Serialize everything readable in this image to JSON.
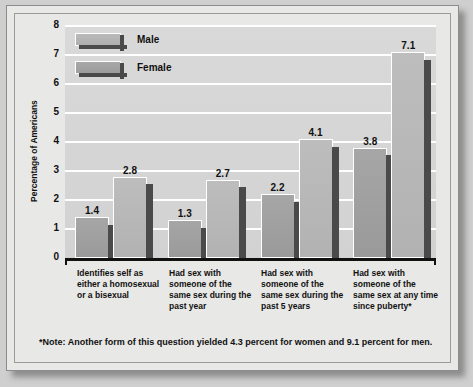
{
  "chart_data": {
    "type": "bar",
    "title": "",
    "xlabel": "",
    "ylabel": "Percentage of Americans",
    "ylim": [
      0,
      8
    ],
    "yticks": [
      "8",
      "7",
      "6",
      "5",
      "4",
      "3",
      "2",
      "1",
      "0"
    ],
    "grid": true,
    "legend_position": "top-left",
    "categories": [
      "Identifies self as either a homosexual or a bisexual",
      "Had sex with someone of the same sex during the past year",
      "Had sex with someone of the same sex during the past 5 years",
      "Had sex with someone of the same sex at any time since puberty*"
    ],
    "series": [
      {
        "name": "Male",
        "values": [
          1.4,
          1.3,
          2.2,
          3.8
        ]
      },
      {
        "name": "Female",
        "values": [
          2.8,
          2.7,
          4.1,
          7.1
        ]
      }
    ],
    "value_labels": [
      "1.4",
      "2.8",
      "1.3",
      "2.7",
      "2.2",
      "4.1",
      "3.8",
      "7.1"
    ],
    "note": "*Note: Another form of this question yielded 4.3 percent for women and 9.1 percent for men."
  },
  "legend": {
    "items": [
      {
        "label": "Male",
        "color": "#aeaeae"
      },
      {
        "label": "Female",
        "color": "#9d9d9d"
      }
    ]
  },
  "colors": {
    "male_bar": "#9a9a9a",
    "female_bar": "#b2b2b2",
    "bar_shadow": "#4a4a4a",
    "plot_background": "#d4d4d4",
    "gridline": "#ffffff",
    "axis": "#111111",
    "card_background": "#e8e8e6"
  }
}
